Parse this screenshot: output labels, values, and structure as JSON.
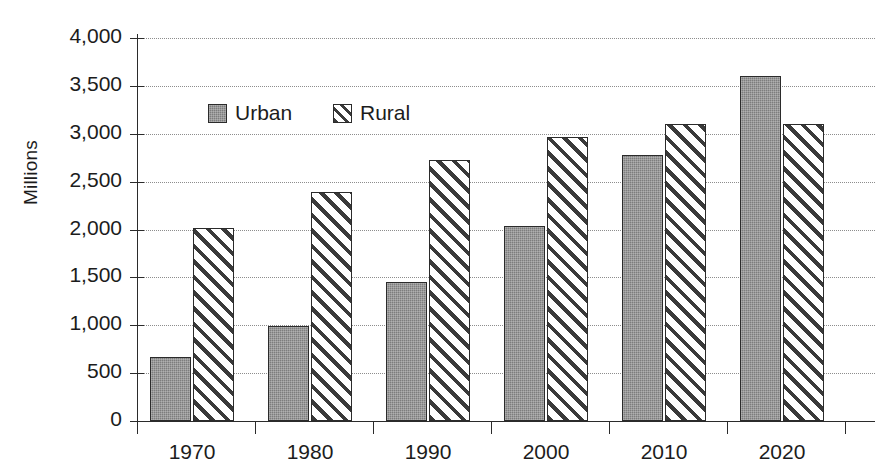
{
  "chart_data": {
    "type": "bar",
    "title": "",
    "xlabel": "",
    "ylabel": "Millions",
    "categories": [
      "1970",
      "1980",
      "1990",
      "2000",
      "2010",
      "2020"
    ],
    "series": [
      {
        "name": "Urban",
        "values": [
          670,
          990,
          1450,
          2040,
          2780,
          3600
        ],
        "fill": "solid-gray",
        "color": "#7d7d7d"
      },
      {
        "name": "Rural",
        "values": [
          2020,
          2390,
          2730,
          2970,
          3100,
          3100
        ],
        "fill": "diagonal-hatch",
        "color": "#ffffff"
      }
    ],
    "ylim": [
      0,
      4000
    ],
    "ytick_values": [
      0,
      500,
      1000,
      1500,
      2000,
      2500,
      3000,
      3500,
      4000
    ],
    "ytick_labels": [
      "0",
      "500",
      "1,000",
      "1,500",
      "2,000",
      "2,500",
      "3,000",
      "3,500",
      "4,000"
    ],
    "grid": true,
    "grid_style": "dotted-horizontal",
    "legend_position": "upper-left-inside"
  },
  "axes": {
    "y_title": "Millions"
  },
  "legend": {
    "entries": [
      {
        "label": "Urban",
        "swatch": "solid-gray-swatch"
      },
      {
        "label": "Rural",
        "swatch": "diagonal-hatch-swatch"
      }
    ]
  }
}
